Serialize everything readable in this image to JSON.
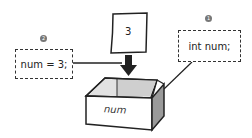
{
  "diagram": {
    "steps": [
      {
        "number": "1",
        "badge": "❶",
        "code": "int num;",
        "description": "declare variable"
      },
      {
        "number": "2",
        "badge": "❷",
        "code": "num = 3;",
        "description": "assign value"
      }
    ],
    "paper_value": "3",
    "container_label": "num",
    "colors": {
      "stroke": "#222222",
      "box_side": "#9a9a9a",
      "box_inner": "#cfcfcf",
      "badge": "#777777"
    }
  }
}
